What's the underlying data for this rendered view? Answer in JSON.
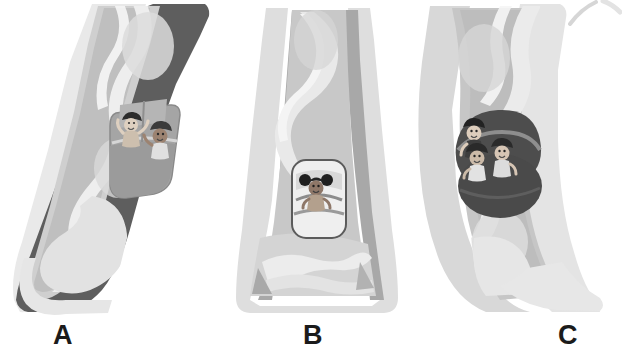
{
  "figure": {
    "caption_labels": [
      {
        "id": "a",
        "text": "A"
      },
      {
        "id": "b",
        "text": "B"
      },
      {
        "id": "c",
        "text": "C"
      }
    ],
    "background_color": "#ffffff",
    "panels": [
      {
        "id": "a",
        "label": "A",
        "description": "Curved slide chute angled left-to-right with dark outer rail, viewed obliquely",
        "riders": 2,
        "car_color": "#9a9a9a",
        "outer_rail_color": "#585858",
        "chute_color": "#c9c9c9",
        "water_color": "#ededed"
      },
      {
        "id": "b",
        "label": "B",
        "description": "Straight slide chute viewed head-on with narrow flume and flared runout",
        "riders": 1,
        "car_color": "#efefef",
        "outer_rail_color": "#cfcfcf",
        "chute_color": "#b4b4b4",
        "water_color": "#e4e4e4"
      },
      {
        "id": "c",
        "label": "C",
        "description": "S-curved slide chute angled right-to-left with light outer rail",
        "riders": 3,
        "car_color": "#4c4c4c",
        "outer_rail_color": "#d9d9d9",
        "chute_color": "#c4c4c4",
        "water_color": "#efefef"
      }
    ],
    "corner_mark": {
      "name": "partial-slide-fragment",
      "color": "#d2d2d2"
    }
  },
  "palette": {
    "ink": "#1b1b1b",
    "dark_rail": "#585858",
    "mid_gray": "#9a9a9a",
    "light_gray": "#c9c9c9",
    "pale_gray": "#e8e8e8",
    "white": "#ffffff",
    "skin_light": "#e7d8c8",
    "skin_dark": "#9b8271",
    "hair_dark": "#2e2e2e"
  }
}
